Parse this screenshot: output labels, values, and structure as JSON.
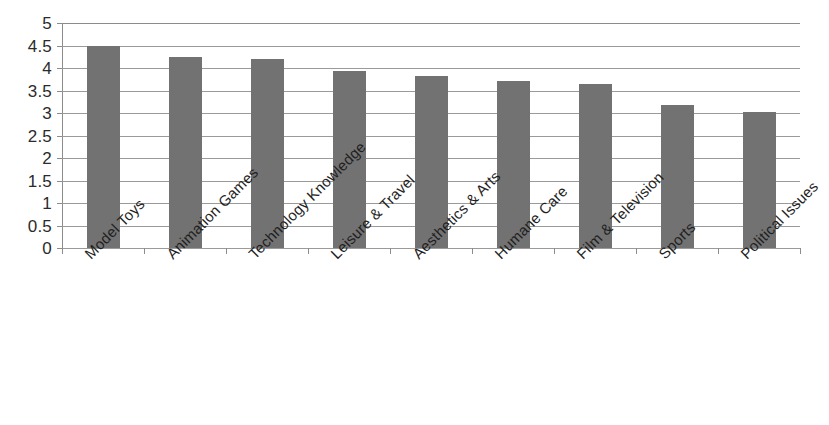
{
  "chart_data": {
    "type": "bar",
    "title": "",
    "subtitle": "",
    "xlabel": "",
    "ylabel": "",
    "ylim": [
      0,
      5
    ],
    "ytick_step": 0.5,
    "grid": true,
    "legend": "none",
    "orientation": "vertical",
    "bar_color": "#727272",
    "plot_background": "#ffffff",
    "gridline_color": "#9a9a9a",
    "axis_color": "#8c8c8c",
    "label_rotation_degrees": -45,
    "categories": [
      "Model Toys",
      "Animation Games",
      "Technology Knowledge",
      "Leisure & Travel",
      "Aesthetics & Arts",
      "Humane Care",
      "Film & Television",
      "Sports",
      "Political Issues"
    ],
    "values": [
      4.5,
      4.25,
      4.2,
      3.93,
      3.82,
      3.71,
      3.65,
      3.17,
      3.03
    ],
    "ytick_labels": [
      "5",
      "4.5",
      "4",
      "3.5",
      "3",
      "2.5",
      "2",
      "1.5",
      "1",
      "0.5",
      "0"
    ],
    "ytick_values": [
      5,
      4.5,
      4,
      3.5,
      3,
      2.5,
      2,
      1.5,
      1,
      0.5,
      0
    ]
  }
}
